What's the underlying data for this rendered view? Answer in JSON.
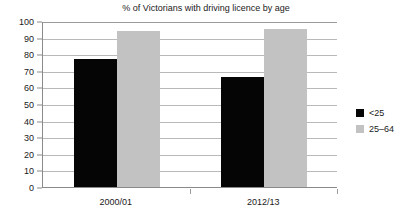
{
  "chart_data": {
    "type": "bar",
    "title": "% of Victorians with driving licence by age",
    "xlabel": "",
    "ylabel": "",
    "categories": [
      "2000/01",
      "2012/13"
    ],
    "series": [
      {
        "name": "<25",
        "color": "#050505",
        "values": [
          77,
          66
        ]
      },
      {
        "name": "25–64",
        "color": "#c2c2c2",
        "values": [
          94,
          95
        ]
      }
    ],
    "ylim": [
      0,
      100
    ],
    "yticks": [
      0,
      10,
      20,
      30,
      40,
      50,
      60,
      70,
      80,
      90,
      100
    ],
    "ytick_labels": [
      "0",
      "10",
      "20",
      "30",
      "40",
      "50",
      "60",
      "70",
      "80",
      "90",
      "100"
    ],
    "grid": true,
    "grid_axis": "y",
    "legend_position": "right",
    "background_color": "#ffffff",
    "gridline_color": "#b9b9b9",
    "axis_color": "#8a8a8a"
  }
}
